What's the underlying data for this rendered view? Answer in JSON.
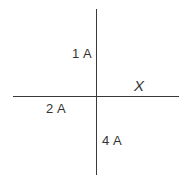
{
  "diagram": {
    "type": "current-junction",
    "axis_label": "X",
    "branches": [
      {
        "id": "up",
        "current": "1 A"
      },
      {
        "id": "left",
        "current": "2 A"
      },
      {
        "id": "down",
        "current": "4 A"
      },
      {
        "id": "right",
        "current": "X"
      }
    ],
    "line_color": "#3a3a3a",
    "text_color": "#333333"
  }
}
